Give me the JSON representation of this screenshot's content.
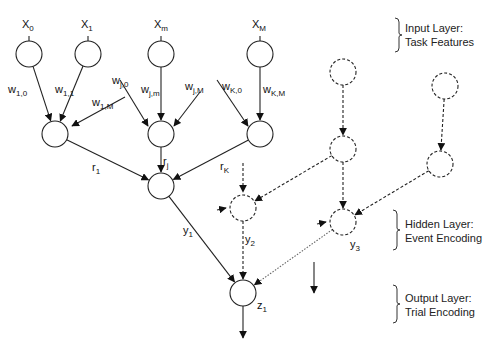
{
  "diagram": {
    "type": "neural-network",
    "nodes": [
      {
        "id": "x0",
        "x": 29,
        "y": 54,
        "style": "solid",
        "label": "X",
        "sub": "0",
        "lx": 22,
        "ly": 28
      },
      {
        "id": "x1",
        "x": 88,
        "y": 54,
        "style": "solid",
        "label": "X",
        "sub": "1",
        "lx": 81,
        "ly": 28
      },
      {
        "id": "xm",
        "x": 161,
        "y": 54,
        "style": "solid",
        "label": "X",
        "sub": "m",
        "lx": 154,
        "ly": 28
      },
      {
        "id": "xM",
        "x": 260,
        "y": 54,
        "style": "solid",
        "label": "X",
        "sub": "M",
        "lx": 252,
        "ly": 28
      },
      {
        "id": "h1",
        "x": 55,
        "y": 134,
        "style": "solid"
      },
      {
        "id": "hj",
        "x": 161,
        "y": 134,
        "style": "solid"
      },
      {
        "id": "hK",
        "x": 260,
        "y": 134,
        "style": "solid"
      },
      {
        "id": "e1",
        "x": 161,
        "y": 186,
        "style": "solid"
      },
      {
        "id": "d_top_l",
        "x": 343,
        "y": 72,
        "style": "dashed"
      },
      {
        "id": "d_top_r",
        "x": 445,
        "y": 86,
        "style": "dashed"
      },
      {
        "id": "d_mid_l",
        "x": 343,
        "y": 149,
        "style": "dashed"
      },
      {
        "id": "d_mid_r",
        "x": 440,
        "y": 164,
        "style": "dashed"
      },
      {
        "id": "e2",
        "x": 243,
        "y": 208,
        "style": "dashed"
      },
      {
        "id": "e3",
        "x": 343,
        "y": 222,
        "style": "dashed"
      },
      {
        "id": "z1",
        "x": 243,
        "y": 293,
        "style": "solid"
      }
    ],
    "edges": [
      {
        "from": "x0",
        "to": "h1",
        "style": "solid"
      },
      {
        "from": "x1",
        "to": "h1",
        "style": "solid"
      },
      {
        "from": "xm",
        "to": "hj",
        "style": "solid"
      },
      {
        "from": "xM",
        "to": "hK",
        "style": "solid"
      },
      {
        "from": "h1",
        "to": "e1",
        "style": "solid"
      },
      {
        "from": "hj",
        "to": "e1",
        "style": "solid"
      },
      {
        "from": "hK",
        "to": "e1",
        "style": "solid"
      },
      {
        "from": "e1",
        "to": "z1",
        "style": "solid"
      },
      {
        "from": "e2",
        "to": "z1",
        "style": "dashed"
      },
      {
        "from": "e3",
        "to": "z1",
        "style": "dotted"
      },
      {
        "from": "d_top_l",
        "to": "d_mid_l",
        "style": "dashed"
      },
      {
        "from": "d_top_r",
        "to": "d_mid_r",
        "style": "dashed"
      },
      {
        "from": "d_mid_l",
        "to": "e2",
        "style": "dashed"
      },
      {
        "from": "d_mid_l",
        "to": "e3",
        "style": "dashed"
      },
      {
        "from": "d_mid_r",
        "to": "e3",
        "style": "dashed"
      }
    ],
    "stubs": [
      {
        "x1": 125,
        "y1": 97,
        "x2": 72,
        "y2": 126,
        "style": "solid"
      },
      {
        "x1": 120,
        "y1": 80,
        "x2": 148,
        "y2": 126,
        "style": "solid"
      },
      {
        "x1": 200,
        "y1": 92,
        "x2": 174,
        "y2": 126,
        "style": "solid"
      },
      {
        "x1": 217,
        "y1": 80,
        "x2": 248,
        "y2": 126,
        "style": "solid"
      },
      {
        "x1": 243,
        "y1": 163,
        "x2": 243,
        "y2": 192,
        "style": "dashed"
      },
      {
        "x1": 217,
        "y1": 210,
        "x2": 226,
        "y2": 208,
        "style": "solid-head"
      },
      {
        "x1": 317,
        "y1": 224,
        "x2": 326,
        "y2": 222,
        "style": "solid-head"
      },
      {
        "x1": 314,
        "y1": 262,
        "x2": 314,
        "y2": 293,
        "style": "solid"
      },
      {
        "x1": 243,
        "y1": 306,
        "x2": 243,
        "y2": 338,
        "style": "solid"
      }
    ],
    "edge_labels": [
      {
        "text": "w",
        "sub": "1,0",
        "x": 8,
        "y": 93
      },
      {
        "text": "w",
        "sub": "1,1",
        "x": 55,
        "y": 93
      },
      {
        "text": "w",
        "sub": "1,M",
        "x": 92,
        "y": 106
      },
      {
        "text": "w",
        "sub": "j,0",
        "x": 112,
        "y": 84
      },
      {
        "text": "w",
        "sub": "j,m",
        "x": 141,
        "y": 93
      },
      {
        "text": "w",
        "sub": "j,M",
        "x": 185,
        "y": 90
      },
      {
        "text": "w",
        "sub": "K,0",
        "x": 222,
        "y": 90
      },
      {
        "text": "w",
        "sub": "K,M",
        "x": 263,
        "y": 93
      },
      {
        "text": "r",
        "sub": "1",
        "x": 92,
        "y": 171
      },
      {
        "text": "r",
        "sub": "j",
        "x": 163,
        "y": 165
      },
      {
        "text": "r",
        "sub": "K",
        "x": 220,
        "y": 170
      },
      {
        "text": "y",
        "sub": "1",
        "x": 183,
        "y": 234
      },
      {
        "text": "y",
        "sub": "2",
        "x": 245,
        "y": 243
      },
      {
        "text": "y",
        "sub": "3",
        "x": 350,
        "y": 248
      },
      {
        "text": "z",
        "sub": "1",
        "x": 257,
        "y": 309
      }
    ],
    "layers": [
      {
        "line1": "Input Layer:",
        "line2": "Task Features",
        "brace_x": 395,
        "y1": 18,
        "y2": 52,
        "tx": 405,
        "ty1": 32,
        "ty2": 46
      },
      {
        "line1": "Hidden Layer:",
        "line2": "Event Encoding",
        "brace_x": 393,
        "y1": 210,
        "y2": 250,
        "tx": 405,
        "ty1": 228,
        "ty2": 242
      },
      {
        "line1": "Output Layer:",
        "line2": "Trial Encoding",
        "brace_x": 393,
        "y1": 285,
        "y2": 323,
        "tx": 405,
        "ty1": 302,
        "ty2": 316
      }
    ],
    "node_radius": 13
  }
}
